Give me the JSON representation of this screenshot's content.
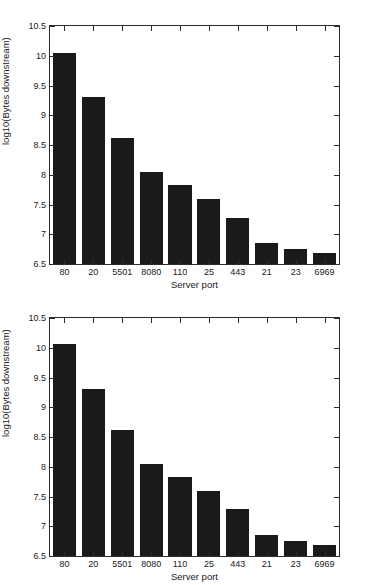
{
  "chart_data": [
    {
      "type": "bar",
      "title": "",
      "xlabel": "Server port",
      "ylabel": "log10(Bytes downstream)",
      "categories": [
        "80",
        "20",
        "5501",
        "8080",
        "110",
        "25",
        "443",
        "21",
        "23",
        "6969"
      ],
      "values": [
        10.05,
        9.31,
        8.62,
        8.04,
        7.83,
        7.6,
        7.28,
        6.86,
        6.75,
        6.69
      ],
      "ylim": [
        6.5,
        10.5
      ],
      "yticks": [
        "6.5",
        "7",
        "7.5",
        "8",
        "8.5",
        "9",
        "9.5",
        "10",
        "10.5"
      ],
      "ytick_values": [
        6.5,
        7,
        7.5,
        8,
        8.5,
        9,
        9.5,
        10,
        10.5
      ],
      "grid": false,
      "legend": null,
      "bar_color": "#1a1a1a",
      "axis_color": "#2b2b2b"
    },
    {
      "type": "bar",
      "title": "",
      "xlabel": "Server port",
      "ylabel": "log10(Bytes downstream)",
      "categories": [
        "80",
        "20",
        "5501",
        "8080",
        "110",
        "25",
        "443",
        "21",
        "23",
        "6969"
      ],
      "values": [
        10.06,
        9.31,
        8.62,
        8.04,
        7.83,
        7.6,
        7.29,
        6.86,
        6.75,
        6.69
      ],
      "ylim": [
        6.5,
        10.5
      ],
      "yticks": [
        "6.5",
        "7",
        "7.5",
        "8",
        "8.5",
        "9",
        "9.5",
        "10",
        "10.5"
      ],
      "ytick_values": [
        6.5,
        7,
        7.5,
        8,
        8.5,
        9,
        9.5,
        10,
        10.5
      ],
      "grid": false,
      "legend": null,
      "bar_color": "#1a1a1a",
      "axis_color": "#2b2b2b"
    }
  ]
}
